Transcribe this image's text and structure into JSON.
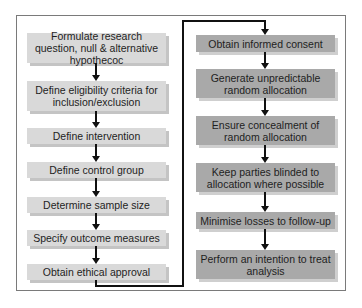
{
  "diagram": {
    "type": "flowchart",
    "left_column": {
      "steps": [
        {
          "label": "Formulate research question, null & alternative hypothecoc"
        },
        {
          "label": "Define eligibility criteria for inclusion/exclusion"
        },
        {
          "label": "Define intervention"
        },
        {
          "label": "Define control group"
        },
        {
          "label": "Determine sample size"
        },
        {
          "label": "Specify outcome measures"
        },
        {
          "label": "Obtain ethical approval"
        }
      ],
      "fill_color": "#d9d9d9"
    },
    "right_column": {
      "steps": [
        {
          "label": "Obtain informed consent"
        },
        {
          "label": "Generate unpredictable random allocation"
        },
        {
          "label": "Ensure concealment of random allocation"
        },
        {
          "label": "Keep parties blinded to allocation where possible"
        },
        {
          "label": "Minimise losses to follow-up"
        },
        {
          "label": "Perform an intention to treat analysis"
        }
      ],
      "fill_color": "#a9a9a9"
    },
    "connector": {
      "from": "Obtain ethical approval",
      "to": "Obtain informed consent"
    }
  }
}
